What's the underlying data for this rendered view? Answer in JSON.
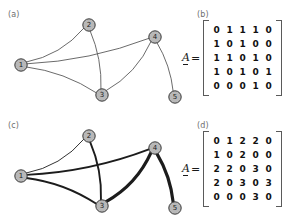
{
  "panels": {
    "a": {
      "label": "(a)",
      "caption_id": "graph-unweighted"
    },
    "b": {
      "label": "(b)",
      "caption_id": "matrix-unweighted"
    },
    "c": {
      "label": "(c)",
      "caption_id": "graph-weighted"
    },
    "d": {
      "label": "(d)",
      "caption_id": "matrix-weighted"
    }
  },
  "matrix_symbol": {
    "name": "A",
    "equals": "="
  },
  "graph_unweighted": {
    "node_labels": [
      "1",
      "2",
      "3",
      "4",
      "5"
    ],
    "nodes": [
      {
        "id": "1",
        "label": "1",
        "x": 21,
        "y": 65
      },
      {
        "id": "2",
        "label": "2",
        "x": 89,
        "y": 25
      },
      {
        "id": "3",
        "label": "3",
        "x": 102,
        "y": 95
      },
      {
        "id": "4",
        "label": "4",
        "x": 155,
        "y": 37
      },
      {
        "id": "5",
        "label": "5",
        "x": 175,
        "y": 97
      }
    ],
    "edges": [
      {
        "from": "1",
        "to": "2",
        "weight": 1
      },
      {
        "from": "1",
        "to": "3",
        "weight": 1
      },
      {
        "from": "1",
        "to": "4",
        "weight": 1
      },
      {
        "from": "2",
        "to": "3",
        "weight": 1
      },
      {
        "from": "3",
        "to": "4",
        "weight": 1
      },
      {
        "from": "4",
        "to": "5",
        "weight": 1
      }
    ]
  },
  "graph_weighted": {
    "node_labels": [
      "1",
      "2",
      "3",
      "4",
      "5"
    ],
    "nodes": [
      {
        "id": "1",
        "label": "1",
        "x": 21,
        "y": 65
      },
      {
        "id": "2",
        "label": "2",
        "x": 89,
        "y": 25
      },
      {
        "id": "3",
        "label": "3",
        "x": 102,
        "y": 95
      },
      {
        "id": "4",
        "label": "4",
        "x": 155,
        "y": 37
      },
      {
        "id": "5",
        "label": "5",
        "x": 175,
        "y": 97
      }
    ],
    "edges": [
      {
        "from": "1",
        "to": "2",
        "weight": 1
      },
      {
        "from": "1",
        "to": "3",
        "weight": 2
      },
      {
        "from": "1",
        "to": "4",
        "weight": 2
      },
      {
        "from": "2",
        "to": "3",
        "weight": 2
      },
      {
        "from": "3",
        "to": "4",
        "weight": 3
      },
      {
        "from": "4",
        "to": "5",
        "weight": 3
      }
    ]
  },
  "chart_data": [
    {
      "type": "table",
      "title": "(b) adjacency matrix",
      "rows": [
        [
          "0",
          "1",
          "1",
          "1",
          "0"
        ],
        [
          "1",
          "0",
          "1",
          "0",
          "0"
        ],
        [
          "1",
          "1",
          "0",
          "1",
          "0"
        ],
        [
          "1",
          "0",
          "1",
          "0",
          "1"
        ],
        [
          "0",
          "0",
          "0",
          "1",
          "0"
        ]
      ]
    },
    {
      "type": "table",
      "title": "(d) weighted adjacency matrix",
      "rows": [
        [
          "0",
          "1",
          "2",
          "2",
          "0"
        ],
        [
          "1",
          "0",
          "2",
          "0",
          "0"
        ],
        [
          "2",
          "2",
          "0",
          "3",
          "0"
        ],
        [
          "2",
          "0",
          "3",
          "0",
          "3"
        ],
        [
          "0",
          "0",
          "0",
          "3",
          "0"
        ]
      ]
    }
  ],
  "colors": {
    "node_fill": "#b8b8b8",
    "node_stroke": "#3a3a3a",
    "edge_thin": "#5a5a5a",
    "edge_weighted": "#1c1c1c",
    "text": "#1a1a1a",
    "panel_label": "#6e6e6e",
    "background": "#ffffff"
  }
}
